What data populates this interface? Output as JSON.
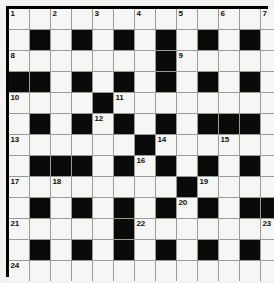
{
  "puzzle": {
    "title": "Crossword Grid",
    "rows": 13,
    "cols": 13,
    "colors": {
      "block": "#0a0a0a",
      "open": "#f6f6f4",
      "grid_line": "#9a9a96",
      "border": "#000000",
      "number_text": "#111111",
      "page_background": "#f2f2f0"
    },
    "legend": {
      "block_symbol": "#",
      "open_symbol": "."
    },
    "grid": [
      "..........,..",
      ".#.#.#.#.#.#.",
      ".......#.....",
      "##.#.#.#.#.#.",
      "....#........",
      ".#.#.#.#.###.",
      "......#......",
      ".###.#.#.#.#.",
      "........#....",
      ".#.#.#.#.#.##",
      ".....#.......",
      ".#.#.#.#.#.#.",
      "............."
    ],
    "grid_rows": [
      [
        ".",
        ".",
        ".",
        ".",
        ".",
        ".",
        ".",
        ".",
        ".",
        ".",
        ".",
        ".",
        "."
      ],
      [
        ".",
        "#",
        ".",
        "#",
        ".",
        "#",
        ".",
        "#",
        ".",
        "#",
        ".",
        "#",
        "."
      ],
      [
        ".",
        ".",
        ".",
        ".",
        ".",
        ".",
        ".",
        "#",
        ".",
        ".",
        ".",
        ".",
        "."
      ],
      [
        "#",
        "#",
        ".",
        "#",
        ".",
        "#",
        ".",
        "#",
        ".",
        "#",
        ".",
        "#",
        "."
      ],
      [
        ".",
        ".",
        ".",
        ".",
        "#",
        ".",
        ".",
        ".",
        ".",
        ".",
        ".",
        ".",
        "."
      ],
      [
        ".",
        "#",
        ".",
        "#",
        ".",
        "#",
        ".",
        "#",
        ".",
        "#",
        "#",
        "#",
        "."
      ],
      [
        ".",
        ".",
        ".",
        ".",
        ".",
        ".",
        "#",
        ".",
        ".",
        ".",
        ".",
        ".",
        "."
      ],
      [
        ".",
        "#",
        "#",
        "#",
        ".",
        "#",
        ".",
        "#",
        ".",
        "#",
        ".",
        "#",
        "."
      ],
      [
        ".",
        ".",
        ".",
        ".",
        ".",
        ".",
        ".",
        ".",
        "#",
        ".",
        ".",
        ".",
        "."
      ],
      [
        ".",
        "#",
        ".",
        "#",
        ".",
        "#",
        ".",
        "#",
        ".",
        "#",
        ".",
        "#",
        "#"
      ],
      [
        ".",
        ".",
        ".",
        ".",
        ".",
        "#",
        ".",
        ".",
        ".",
        ".",
        ".",
        ".",
        "."
      ],
      [
        ".",
        "#",
        ".",
        "#",
        ".",
        "#",
        ".",
        "#",
        ".",
        "#",
        ".",
        "#",
        "."
      ],
      [
        ".",
        ".",
        ".",
        ".",
        ".",
        ".",
        ".",
        ".",
        ".",
        ".",
        ".",
        ".",
        "."
      ]
    ],
    "numbers": [
      {
        "row": 1,
        "col": 1,
        "n": "1"
      },
      {
        "row": 1,
        "col": 3,
        "n": "2"
      },
      {
        "row": 1,
        "col": 5,
        "n": "3"
      },
      {
        "row": 1,
        "col": 7,
        "n": "4"
      },
      {
        "row": 1,
        "col": 9,
        "n": "5"
      },
      {
        "row": 1,
        "col": 11,
        "n": "6"
      },
      {
        "row": 1,
        "col": 13,
        "n": "7"
      },
      {
        "row": 3,
        "col": 1,
        "n": "8"
      },
      {
        "row": 3,
        "col": 9,
        "n": "9"
      },
      {
        "row": 5,
        "col": 1,
        "n": "10"
      },
      {
        "row": 5,
        "col": 6,
        "n": "11"
      },
      {
        "row": 6,
        "col": 5,
        "n": "12"
      },
      {
        "row": 7,
        "col": 1,
        "n": "13"
      },
      {
        "row": 7,
        "col": 8,
        "n": "14"
      },
      {
        "row": 7,
        "col": 11,
        "n": "15"
      },
      {
        "row": 8,
        "col": 7,
        "n": "16"
      },
      {
        "row": 9,
        "col": 1,
        "n": "17"
      },
      {
        "row": 9,
        "col": 3,
        "n": "18"
      },
      {
        "row": 9,
        "col": 10,
        "n": "19"
      },
      {
        "row": 10,
        "col": 9,
        "n": "20"
      },
      {
        "row": 11,
        "col": 1,
        "n": "21"
      },
      {
        "row": 11,
        "col": 7,
        "n": "22"
      },
      {
        "row": 11,
        "col": 13,
        "n": "23"
      },
      {
        "row": 13,
        "col": 1,
        "n": "24"
      }
    ],
    "entries": []
  }
}
